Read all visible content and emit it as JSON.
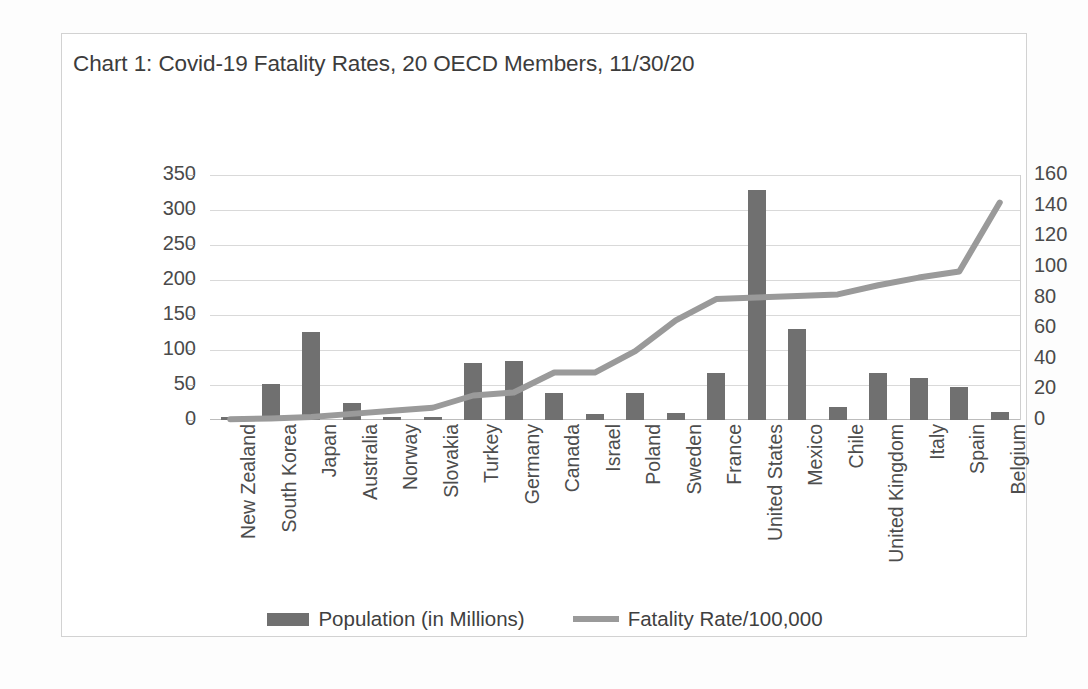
{
  "chart_data": {
    "type": "bar",
    "title": "Chart 1: Covid-19 Fatality Rates, 20 OECD Members, 11/30/20",
    "xlabel": "",
    "ylabel": "",
    "grid": true,
    "legend_position": "bottom",
    "categories": [
      "New Zealand",
      "South Korea",
      "Japan",
      "Australia",
      "Norway",
      "Slovakia",
      "Turkey",
      "Germany",
      "Canada",
      "Israel",
      "Poland",
      "Sweden",
      "France",
      "United States",
      "Mexico",
      "Chile",
      "United Kingdom",
      "Italy",
      "Spain",
      "Belgium"
    ],
    "series": [
      {
        "name": "Population (in Millions)",
        "type": "bar",
        "axis": "left",
        "color": "#707070",
        "values": [
          5,
          52,
          126,
          25,
          5,
          5,
          82,
          84,
          38,
          9,
          38,
          10,
          67,
          328,
          130,
          19,
          67,
          60,
          47,
          11
        ]
      },
      {
        "name": "Fatality Rate/100,000",
        "type": "line",
        "axis": "right",
        "color": "#9a9a9a",
        "values": [
          0.5,
          1,
          2,
          4,
          6,
          8,
          16,
          18,
          31,
          31,
          45,
          65,
          79,
          80,
          81,
          82,
          88,
          93,
          97,
          142
        ]
      }
    ],
    "left_axis": {
      "min": 0,
      "max": 350,
      "step": 50,
      "ticks": [
        "0",
        "50",
        "100",
        "150",
        "200",
        "250",
        "300",
        "350"
      ]
    },
    "right_axis": {
      "min": 0,
      "max": 160,
      "step": 20,
      "ticks": [
        "0",
        "20",
        "40",
        "60",
        "80",
        "100",
        "120",
        "140",
        "160"
      ]
    }
  },
  "legend": {
    "items": [
      {
        "label": "Population (in Millions)",
        "marker": "bar-swatch-icon",
        "color": "#707070"
      },
      {
        "label": "Fatality Rate/100,000",
        "marker": "line-swatch-icon",
        "color": "#9a9a9a"
      }
    ]
  }
}
